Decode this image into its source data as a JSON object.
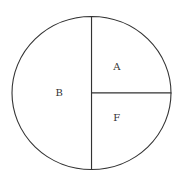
{
  "chart_data": {
    "type": "pie",
    "title": "",
    "slices": [
      {
        "label": "A",
        "value": 25
      },
      {
        "label": "F",
        "value": 25
      },
      {
        "label": "B",
        "value": 50
      }
    ],
    "start": "top",
    "direction": "clockwise",
    "legend": "none",
    "colors": {
      "fill": "#ffffff",
      "stroke": "#333333"
    }
  }
}
